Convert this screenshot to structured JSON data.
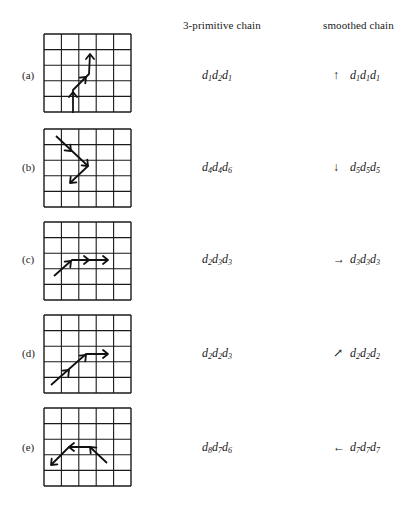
{
  "headers": {
    "primitive": "3-primitive chain",
    "smoothed": "smoothed chain"
  },
  "grid_spec": {
    "cols": 5,
    "rows": 5,
    "cell_w": 17.4,
    "cell_h": 15.6,
    "stroke": "#1a1a1a"
  },
  "rows": [
    {
      "label": "(a)",
      "top": 33,
      "text_y": 69,
      "primitive_chain": [
        [
          "d",
          "1"
        ],
        [
          "d",
          "2"
        ],
        [
          "d",
          "1"
        ]
      ],
      "primitive_text": "d1d2d1",
      "smoothed_arrow": "↑",
      "smoothed_chain": [
        [
          "d",
          "1"
        ],
        [
          "d",
          "1"
        ],
        [
          "d",
          "1"
        ]
      ],
      "smoothed_text": "d1d1d1",
      "path": [
        [
          29,
          80
        ],
        [
          29,
          56
        ],
        [
          45,
          40
        ],
        [
          46,
          20
        ]
      ],
      "arrowheads": [
        [
          29,
          58,
          "up"
        ],
        [
          42,
          43,
          "ne"
        ],
        [
          46,
          20,
          "up"
        ]
      ]
    },
    {
      "label": "(b)",
      "top": 128,
      "text_y": 161,
      "primitive_chain": [
        [
          "d",
          "4"
        ],
        [
          "d",
          "4"
        ],
        [
          "d",
          "6"
        ]
      ],
      "primitive_text": "d4d4d6",
      "smoothed_arrow": "↓",
      "smoothed_chain": [
        [
          "d",
          "5"
        ],
        [
          "d",
          "5"
        ],
        [
          "d",
          "5"
        ]
      ],
      "smoothed_text": "d5d5d5",
      "path": [
        [
          12,
          7
        ],
        [
          44,
          37
        ],
        [
          26,
          54
        ]
      ],
      "arrowheads": [
        [
          27,
          22,
          "se"
        ],
        [
          44,
          37,
          "se"
        ],
        [
          26,
          54,
          "sw"
        ]
      ]
    },
    {
      "label": "(c)",
      "top": 221,
      "text_y": 253,
      "primitive_chain": [
        [
          "d",
          "2"
        ],
        [
          "d",
          "3"
        ],
        [
          "d",
          "3"
        ]
      ],
      "primitive_text": "d2d3d3",
      "smoothed_arrow": "→",
      "smoothed_chain": [
        [
          "d",
          "3"
        ],
        [
          "d",
          "3"
        ],
        [
          "d",
          "3"
        ]
      ],
      "smoothed_text": "d3d3d3",
      "path": [
        [
          10,
          54
        ],
        [
          28,
          38
        ],
        [
          64,
          38
        ]
      ],
      "arrowheads": [
        [
          27,
          39,
          "ne"
        ],
        [
          45,
          38,
          "right"
        ],
        [
          64,
          38,
          "right"
        ]
      ]
    },
    {
      "label": "(d)",
      "top": 314,
      "text_y": 347,
      "primitive_chain": [
        [
          "d",
          "2"
        ],
        [
          "d",
          "2"
        ],
        [
          "d",
          "3"
        ]
      ],
      "primitive_text": "d2d2d3",
      "smoothed_arrow": "↗",
      "smoothed_chain": [
        [
          "d",
          "2"
        ],
        [
          "d",
          "2"
        ],
        [
          "d",
          "2"
        ]
      ],
      "smoothed_text": "d2d2d2",
      "path": [
        [
          7,
          70
        ],
        [
          42,
          39
        ],
        [
          64,
          39
        ]
      ],
      "arrowheads": [
        [
          25,
          55,
          "ne"
        ],
        [
          42,
          40,
          "ne"
        ],
        [
          64,
          39,
          "right"
        ]
      ]
    },
    {
      "label": "(e)",
      "top": 407,
      "text_y": 441,
      "primitive_chain": [
        [
          "d",
          "8"
        ],
        [
          "d",
          "7"
        ],
        [
          "d",
          "6"
        ]
      ],
      "primitive_text": "d8d7d6",
      "smoothed_arrow": "←",
      "smoothed_chain": [
        [
          "d",
          "7"
        ],
        [
          "d",
          "7"
        ],
        [
          "d",
          "7"
        ]
      ],
      "smoothed_text": "d7d7d7",
      "path": [
        [
          63,
          55
        ],
        [
          46,
          39
        ],
        [
          25,
          39
        ],
        [
          7,
          57
        ]
      ],
      "arrowheads": [
        [
          46,
          39,
          "nw"
        ],
        [
          25,
          39,
          "left"
        ],
        [
          7,
          57,
          "sw"
        ]
      ]
    }
  ]
}
